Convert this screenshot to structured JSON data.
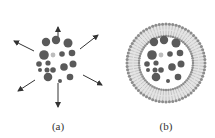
{
  "diagram": {
    "panels": [
      {
        "id": "a",
        "label": "(a)",
        "description": "free particles dispersing",
        "center": [
          58,
          63
        ],
        "label_x": 58,
        "arrows": true,
        "membrane": false
      },
      {
        "id": "b",
        "label": "(b)",
        "description": "particles encapsulated in liposome bilayer",
        "center": [
          166,
          63
        ],
        "label_x": 166,
        "arrows": false,
        "membrane": true
      }
    ],
    "arrows": [
      {
        "dx1": 0,
        "dy1": -20,
        "dx2": 0,
        "dy2": -36
      },
      {
        "dx1": 22,
        "dy1": -14,
        "dx2": 40,
        "dy2": -28
      },
      {
        "dx1": -24,
        "dy1": -12,
        "dx2": -44,
        "dy2": -22
      },
      {
        "dx1": 25,
        "dy1": 12,
        "dx2": 44,
        "dy2": 22
      },
      {
        "dx1": -23,
        "dy1": 17,
        "dx2": -40,
        "dy2": 28
      },
      {
        "dx1": 0,
        "dy1": 20,
        "dx2": 0,
        "dy2": 44
      }
    ],
    "particles": [
      {
        "x": -12,
        "y": -21,
        "r": 4.2,
        "shade": "dark"
      },
      {
        "x": -2,
        "y": -23,
        "r": 4.2,
        "shade": "dark"
      },
      {
        "x": 10,
        "y": -20,
        "r": 4.5,
        "shade": "dark"
      },
      {
        "x": -14,
        "y": -8,
        "r": 4.8,
        "shade": "dark"
      },
      {
        "x": -5,
        "y": -8,
        "r": 2.4,
        "shade": "light"
      },
      {
        "x": 4,
        "y": -9,
        "r": 2.8,
        "shade": "dark"
      },
      {
        "x": 14,
        "y": -10,
        "r": 3.3,
        "shade": "dark"
      },
      {
        "x": -19,
        "y": 1,
        "r": 2.8,
        "shade": "dark"
      },
      {
        "x": -10,
        "y": 0,
        "r": 2.6,
        "shade": "dark"
      },
      {
        "x": -18,
        "y": 7,
        "r": 2.0,
        "shade": "dark"
      },
      {
        "x": -11,
        "y": 7,
        "r": 2.5,
        "shade": "dark"
      },
      {
        "x": -5,
        "y": 7,
        "r": 2.8,
        "shade": "dark"
      },
      {
        "x": 6,
        "y": 4,
        "r": 3.8,
        "shade": "dark"
      },
      {
        "x": 15,
        "y": 1,
        "r": 3.5,
        "shade": "dark"
      },
      {
        "x": -10,
        "y": 14,
        "r": 4.3,
        "shade": "dark"
      },
      {
        "x": 12,
        "y": 14,
        "r": 3.3,
        "shade": "dark"
      },
      {
        "x": 2,
        "y": 18,
        "r": 2.0,
        "shade": "dark"
      }
    ],
    "membrane": {
      "outer_r": 40,
      "inner_r": 26,
      "head_count": 72
    },
    "colors": {
      "particle_dark": "#5a5a5a",
      "particle_light": "#bdbdbd",
      "arrow": "#333333",
      "membrane_head": "#8c8c8c",
      "membrane_tail": "#bcbcbc",
      "background": "#ffffff"
    }
  }
}
